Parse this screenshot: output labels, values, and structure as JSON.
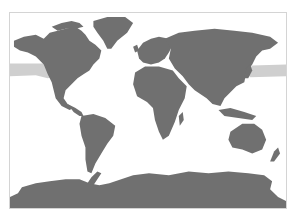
{
  "map": {
    "projection": "world-equirectangular-like",
    "colors": {
      "land": "#707070",
      "ocean": "#ffffff",
      "highlight_band": "#cfcfcf",
      "frame": "#d4d4d4"
    },
    "highlighted_region": "North Pacific band",
    "regions": [
      "North America",
      "Greenland",
      "South America",
      "Europe",
      "Africa",
      "Asia",
      "Australia",
      "New Zealand",
      "Antarctica"
    ]
  }
}
